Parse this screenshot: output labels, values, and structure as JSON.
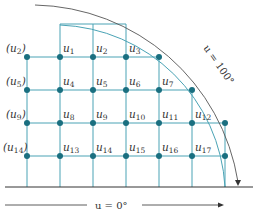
{
  "diagram": {
    "colors": {
      "grid": "#4aa3b5",
      "node": "#1a6f80",
      "axis": "#333333",
      "arc": "#555555"
    },
    "top_label": "u = 100°",
    "bottom_label": "u = 0°",
    "left_labels": [
      {
        "text": "(u",
        "sub": "2",
        "close": ")"
      },
      {
        "text": "(u",
        "sub": "5",
        "close": ")"
      },
      {
        "text": "(u",
        "sub": "9",
        "close": ")"
      },
      {
        "text": "(u",
        "sub": "14",
        "close": ")"
      }
    ],
    "nodes": [
      {
        "name": "u",
        "sub": "1"
      },
      {
        "name": "u",
        "sub": "2"
      },
      {
        "name": "u",
        "sub": "3"
      },
      {
        "name": "u",
        "sub": "4"
      },
      {
        "name": "u",
        "sub": "5"
      },
      {
        "name": "u",
        "sub": "6"
      },
      {
        "name": "u",
        "sub": "7"
      },
      {
        "name": "u",
        "sub": "8"
      },
      {
        "name": "u",
        "sub": "9"
      },
      {
        "name": "u",
        "sub": "10"
      },
      {
        "name": "u",
        "sub": "11"
      },
      {
        "name": "u",
        "sub": "12"
      },
      {
        "name": "u",
        "sub": "13"
      },
      {
        "name": "u",
        "sub": "14"
      },
      {
        "name": "u",
        "sub": "15"
      },
      {
        "name": "u",
        "sub": "16"
      },
      {
        "name": "u",
        "sub": "17"
      }
    ]
  }
}
